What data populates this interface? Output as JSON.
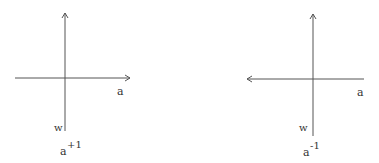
{
  "diagrams": [
    {
      "name": "left",
      "horizontal_axis_label": "a",
      "vertical_axis_label": "w",
      "caption_base": "a",
      "caption_exponent": "+1",
      "arrow_direction": "right"
    },
    {
      "name": "right",
      "horizontal_axis_label": "a",
      "vertical_axis_label": "w",
      "caption_base": "a",
      "caption_exponent": "-1",
      "arrow_direction": "left"
    }
  ],
  "colors": {
    "line": "#555555",
    "text": "#333333"
  }
}
